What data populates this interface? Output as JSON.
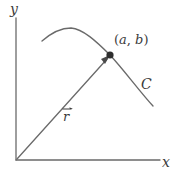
{
  "figure": {
    "background_color": "#ffffff",
    "stroke_color": "#555555",
    "text_color": "#3b3b3b",
    "axes": {
      "y_axis_label": "y",
      "x_axis_label": "x",
      "origin": [
        16,
        160
      ],
      "y_axis_top": [
        16,
        18
      ],
      "x_axis_right": [
        160,
        160
      ]
    },
    "curve": {
      "name_label": "C",
      "description": "smooth arc rising from lower-left, peaking, then descending to lower-right",
      "path_points": [
        [
          42,
          41
        ],
        [
          55,
          32
        ],
        [
          70,
          28
        ],
        [
          88,
          36
        ],
        [
          110,
          55
        ],
        [
          128,
          76
        ],
        [
          141,
          92
        ],
        [
          153,
          106
        ]
      ]
    },
    "point": {
      "label": "(a, b)",
      "label_open": "(",
      "label_a": "a",
      "label_comma": ", ",
      "label_b": "b",
      "label_close": ")",
      "coords": [
        110,
        55
      ],
      "marker": "filled-dot"
    },
    "vector": {
      "label": "r",
      "notation": "arrow-over-r",
      "from": [
        16,
        160
      ],
      "to": [
        110,
        56
      ],
      "arrowhead": "at-point"
    }
  }
}
